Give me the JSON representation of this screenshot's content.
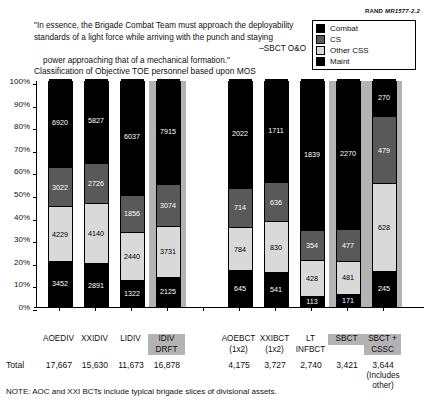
{
  "credit": {
    "org": "RAND",
    "number": "MR1577-2.2"
  },
  "quote": {
    "lines": [
      "\"In essence, the Brigade Combat Team must approach the deployability",
      "standards of a light force while arriving with the punch and staying",
      "power approaching that of a mechanical formation.\""
    ],
    "attribution": "–SBCT O&O"
  },
  "chart_title": "Classification of Objective TOE personnel based upon MOS",
  "legend": {
    "items": [
      {
        "label": "Combat",
        "color": "#000000",
        "key": "combat"
      },
      {
        "label": "CS",
        "color": "#595959",
        "key": "cs"
      },
      {
        "label": "Other CSS",
        "color": "#d9d9d9",
        "key": "other_css"
      },
      {
        "label": "Maint",
        "color": "#000000",
        "key": "maint"
      }
    ]
  },
  "totals_label": "Total",
  "note": "NOTE:  AOC and XXI BCTs include typical brigade slices of divisional assets.",
  "chart_data": {
    "type": "bar",
    "subtype": "stacked-100-percent",
    "title": "Classification of Objective TOE personnel based upon MOS",
    "xlabel": "",
    "ylabel": "",
    "ylim": [
      0,
      100
    ],
    "ytick_labels": [
      "0%",
      "10%",
      "20%",
      "30%",
      "40%",
      "50%",
      "60%",
      "70%",
      "80%",
      "90%",
      "100%"
    ],
    "ytick_values": [
      0,
      10,
      20,
      30,
      40,
      50,
      60,
      70,
      80,
      90,
      100
    ],
    "grid": false,
    "legend_position": "top-right",
    "stack_order_bottom_to_top": [
      "Maint",
      "Other CSS",
      "CS",
      "Combat"
    ],
    "categories": [
      {
        "id": "aoediv",
        "line1": "AOEDIV",
        "line2": "",
        "highlight": false,
        "total": "17,667",
        "total_note": ""
      },
      {
        "id": "xxidiv",
        "line1": "XXIDIV",
        "line2": "",
        "highlight": false,
        "total": "15,630",
        "total_note": ""
      },
      {
        "id": "lidiv",
        "line1": "LIDIV",
        "line2": "",
        "highlight": false,
        "total": "11,673",
        "total_note": ""
      },
      {
        "id": "idivdrft",
        "line1": "IDIV",
        "line2": "DRFT",
        "highlight": true,
        "total": "16,878",
        "total_note": ""
      },
      {
        "id": "gap",
        "line1": "",
        "line2": "",
        "highlight": false,
        "total": "",
        "total_note": ""
      },
      {
        "id": "aoebct",
        "line1": "AOEBCT",
        "line2": "(1x2)",
        "highlight": false,
        "total": "4,175",
        "total_note": ""
      },
      {
        "id": "xxibct",
        "line1": "XXIBCT",
        "line2": "(1x2)",
        "highlight": false,
        "total": "3,727",
        "total_note": ""
      },
      {
        "id": "ltinfbct",
        "line1": "LT",
        "line2": "INFBCT",
        "highlight": false,
        "total": "2,740",
        "total_note": ""
      },
      {
        "id": "sbct",
        "line1": "SBCT",
        "line2": "",
        "highlight": true,
        "total": "3,421",
        "total_note": ""
      },
      {
        "id": "sbctcssc",
        "line1": "SBCT +",
        "line2": "CSSC",
        "highlight": true,
        "total": "3,644",
        "total_note": "(Includes\nother)"
      }
    ],
    "series": [
      {
        "name": "Maint",
        "color": "#000000",
        "values": [
          3452,
          2891,
          1322,
          2125,
          null,
          645,
          541,
          113,
          171,
          245
        ]
      },
      {
        "name": "Other CSS",
        "color": "#d9d9d9",
        "values": [
          4229,
          4140,
          2440,
          3731,
          null,
          784,
          830,
          428,
          481,
          628
        ]
      },
      {
        "name": "CS",
        "color": "#595959",
        "values": [
          3022,
          2726,
          1856,
          3074,
          null,
          714,
          636,
          354,
          477,
          479
        ]
      },
      {
        "name": "Combat",
        "color": "#000000",
        "values": [
          6920,
          5827,
          6037,
          7915,
          null,
          2022,
          1711,
          1839,
          2270,
          270
        ]
      }
    ]
  }
}
